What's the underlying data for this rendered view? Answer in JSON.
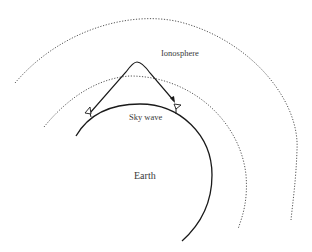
{
  "diagram": {
    "type": "sky-wave propagation",
    "labels": {
      "ionosphere": "Ionosphere",
      "sky_wave": "Sky wave",
      "earth": "Earth"
    },
    "colors": {
      "line": "#1a1a1a",
      "dotted": "#555555",
      "text": "#3a3a3a",
      "background": "#ffffff"
    },
    "elements": [
      {
        "name": "earth-surface",
        "style": "solid arc"
      },
      {
        "name": "ionosphere-lower-boundary",
        "style": "dotted arc"
      },
      {
        "name": "ionosphere-upper-boundary",
        "style": "dotted arc"
      },
      {
        "name": "transmitting-antenna",
        "style": "triangle"
      },
      {
        "name": "receiving-antenna",
        "style": "triangle"
      },
      {
        "name": "sky-wave-path",
        "style": "solid curve with arrow"
      }
    ]
  }
}
